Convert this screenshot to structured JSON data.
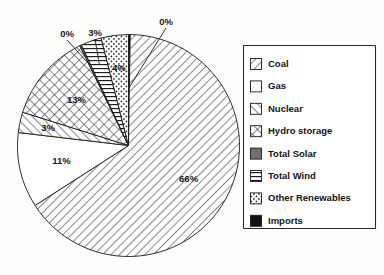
{
  "chart_data": {
    "type": "pie",
    "title": "",
    "subtitle": "",
    "xlabel": "",
    "ylabel": "",
    "grid": false,
    "legend_position": "right",
    "start_angle_deg": 0,
    "direction": "clockwise",
    "categories": [
      "Imports",
      "Coal",
      "Gas",
      "Nuclear",
      "Hydro storage",
      "Total Solar",
      "Total Wind",
      "Other Renewables"
    ],
    "values": [
      0,
      66,
      11,
      3,
      13,
      0,
      3,
      4
    ],
    "data_labels": [
      "0%",
      "66%",
      "11%",
      "3%",
      "13%",
      "0%",
      "3%",
      "4%"
    ],
    "slices": [
      {
        "name": "Imports",
        "label": "0%",
        "value": 0,
        "pattern": "solid-black",
        "color": "#111111",
        "has_leader": true
      },
      {
        "name": "Coal",
        "label": "66%",
        "value": 66,
        "pattern": "diagonal-forward",
        "color": "#ffffff",
        "has_leader": false
      },
      {
        "name": "Gas",
        "label": "11%",
        "value": 11,
        "pattern": "blank",
        "color": "#ffffff",
        "has_leader": false
      },
      {
        "name": "Nuclear",
        "label": "3%",
        "value": 3,
        "pattern": "diagonal-back",
        "color": "#ffffff",
        "has_leader": false
      },
      {
        "name": "Hydro storage",
        "label": "13%",
        "value": 13,
        "pattern": "crosshatch",
        "color": "#ffffff",
        "has_leader": false
      },
      {
        "name": "Total Solar",
        "label": "0%",
        "value": 0,
        "pattern": "solid-gray",
        "color": "#6f6f6f",
        "has_leader": true
      },
      {
        "name": "Total Wind",
        "label": "3%",
        "value": 3,
        "pattern": "horizontal-lines",
        "color": "#ffffff",
        "has_leader": true
      },
      {
        "name": "Other Renewables",
        "label": "4%",
        "value": 4,
        "pattern": "dots",
        "color": "#ffffff",
        "has_leader": false
      }
    ]
  },
  "legend": {
    "items": [
      {
        "label": "Coal",
        "pattern": "diagonal-forward"
      },
      {
        "label": "Gas",
        "pattern": "blank"
      },
      {
        "label": "Nuclear",
        "pattern": "diagonal-back"
      },
      {
        "label": "Hydro storage",
        "pattern": "crosshatch"
      },
      {
        "label": "Total Solar",
        "pattern": "solid-gray"
      },
      {
        "label": "Total Wind",
        "pattern": "horizontal-lines"
      },
      {
        "label": "Other Renewables",
        "pattern": "dots"
      },
      {
        "label": "Imports",
        "pattern": "solid-black"
      }
    ]
  },
  "colors": {
    "background": "#fdfdfb",
    "outline": "#181818",
    "text": "#141414",
    "solar_fill": "#6f6f6f",
    "imports_fill": "#111111"
  }
}
